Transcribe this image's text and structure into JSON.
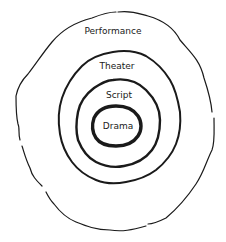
{
  "diagram": {
    "type": "concentric-nested-circles",
    "style": "hand-drawn",
    "colors": {
      "line": "#1a1a1a",
      "background": "#ffffff"
    },
    "layers": [
      {
        "label": "Performance",
        "level": 1
      },
      {
        "label": "Theater",
        "level": 2
      },
      {
        "label": "Script",
        "level": 3
      },
      {
        "label": "Drama",
        "level": 4
      }
    ]
  }
}
